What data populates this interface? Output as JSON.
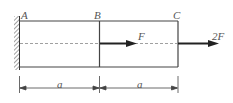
{
  "diagram": {
    "points": {
      "A": "A",
      "B": "B",
      "C": "C"
    },
    "forces": {
      "F": "F",
      "F2": "2F"
    },
    "dimensions": {
      "AB": "a",
      "BC": "a"
    }
  }
}
